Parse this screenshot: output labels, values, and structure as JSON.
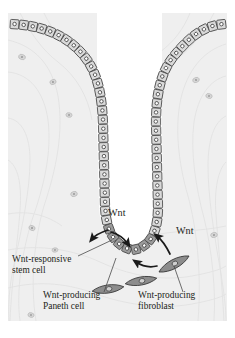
{
  "figure": {
    "kind": "biological-diagram",
    "panel": {
      "background_color": "#efefef",
      "page_color": "#ffffff",
      "x": 8,
      "y": 13,
      "width": 219,
      "height": 308
    },
    "palette": {
      "cell_fill": "#d9d9d9",
      "cell_stroke": "#4a4a4a",
      "nucleus_fill": "#ffffff",
      "nucleus_stroke": "#3d3d3d",
      "paneth_fill": "#9a9a9a",
      "fibroblast_fill": "#8c8c8c",
      "fibroblast_stroke": "#3a3a3a",
      "stroma_line": "#e2e2e2",
      "lumen_fill": "#ffffff",
      "text_color": "#231f20",
      "leader_color": "#4a4a4a",
      "arrow_color": "#1a1a1a"
    }
  },
  "signals": [
    {
      "id": "wnt-paneth",
      "label": "Wnt",
      "x": 108,
      "y": 216
    },
    {
      "id": "wnt-fibroblast",
      "label": "Wnt",
      "x": 176,
      "y": 234
    }
  ],
  "labels": [
    {
      "id": "wnt-responsive-stem-cell",
      "lines": [
        "Wnt-responsive",
        "stem cell"
      ],
      "x": 12,
      "y": 262,
      "leader": {
        "x1": 78,
        "y1": 256,
        "x2": 112,
        "y2": 240
      }
    },
    {
      "id": "wnt-producing-paneth-cell",
      "lines": [
        "Wnt-producing",
        "Paneth cell"
      ],
      "x": 43,
      "y": 298,
      "leader": {
        "x1": 104,
        "y1": 292,
        "x2": 116,
        "y2": 258
      }
    },
    {
      "id": "wnt-producing-fibroblast",
      "lines": [
        "Wnt-producing",
        "fibroblast"
      ],
      "x": 138,
      "y": 298,
      "leader": {
        "x1": 183,
        "y1": 292,
        "x2": 174,
        "y2": 266
      }
    }
  ],
  "cell_types": [
    {
      "id": "epithelial-cell",
      "name": "columnar epithelial cell",
      "count": 62
    },
    {
      "id": "paneth-cell",
      "name": "Paneth cell",
      "count": 7
    },
    {
      "id": "fibroblast",
      "name": "fibroblast",
      "count": 3
    },
    {
      "id": "stromal-cell",
      "name": "stromal cell",
      "count": 11
    }
  ],
  "fibroblasts": [
    {
      "id": "fibroblast-1",
      "cx": 174,
      "cy": 264,
      "rx": 17,
      "ry": 6.0,
      "rot": -28
    },
    {
      "id": "fibroblast-2",
      "cx": 141,
      "cy": 281,
      "rx": 16,
      "ry": 5.4,
      "rot": -10
    },
    {
      "id": "fibroblast-3",
      "cx": 108,
      "cy": 289,
      "rx": 16,
      "ry": 5.4,
      "rot": -8
    }
  ],
  "stromal_cells": [
    {
      "cx": 22,
      "cy": 57,
      "r": 2.6,
      "rot": 18
    },
    {
      "cx": 53,
      "cy": 82,
      "r": 2.4,
      "rot": -22
    },
    {
      "cx": 69,
      "cy": 115,
      "r": 2.3,
      "rot": 10
    },
    {
      "cx": 74,
      "cy": 194,
      "r": 2.5,
      "rot": -14
    },
    {
      "cx": 32,
      "cy": 228,
      "r": 2.4,
      "rot": 25
    },
    {
      "cx": 55,
      "cy": 250,
      "r": 2.2,
      "rot": -8
    },
    {
      "cx": 31,
      "cy": 315,
      "r": 2.3,
      "rot": 14
    },
    {
      "cx": 196,
      "cy": 80,
      "r": 2.5,
      "rot": -20
    },
    {
      "cx": 209,
      "cy": 96,
      "r": 2.4,
      "rot": 16
    },
    {
      "cx": 214,
      "cy": 235,
      "r": 2.5,
      "rot": -12
    },
    {
      "cx": 152,
      "cy": 101,
      "r": 2.2,
      "rot": 8
    }
  ]
}
